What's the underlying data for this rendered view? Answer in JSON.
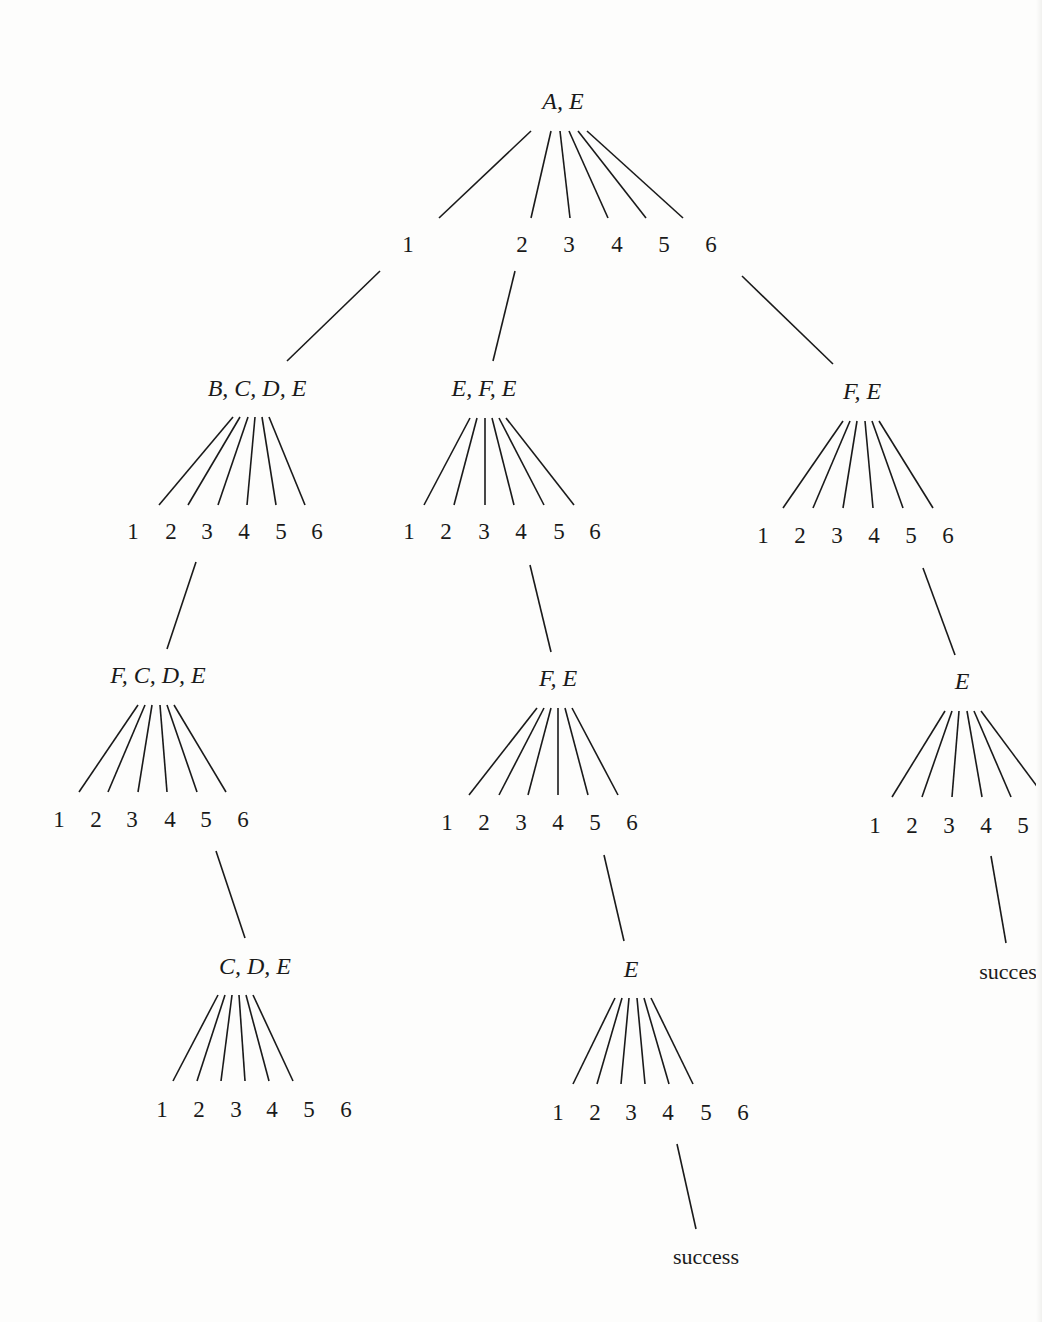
{
  "diagram": {
    "type": "search-tree",
    "colors": {
      "ink": "#1a1a1a",
      "background": "#fdfdfc"
    },
    "nodes": [
      {
        "id": "root",
        "label": "A, E",
        "x": 563,
        "y": 101
      },
      {
        "id": "n1",
        "label": "B, C, D, E",
        "x": 257,
        "y": 388
      },
      {
        "id": "n2",
        "label": "E, F, E",
        "x": 484,
        "y": 388
      },
      {
        "id": "n3",
        "label": "F, E",
        "x": 862,
        "y": 391
      },
      {
        "id": "n1_3",
        "label": "F, C, D, E",
        "x": 158,
        "y": 675
      },
      {
        "id": "n2_4",
        "label": "F, E",
        "x": 558,
        "y": 678
      },
      {
        "id": "n3_5",
        "label": "E",
        "x": 962,
        "y": 681
      },
      {
        "id": "n1_3_6",
        "label": "C, D, E",
        "x": 255,
        "y": 966
      },
      {
        "id": "n2_4_6",
        "label": "E",
        "x": 631,
        "y": 969
      }
    ],
    "branch_rows": [
      {
        "parent": "root",
        "labels": [
          "1",
          "2",
          "3",
          "4",
          "5",
          "6"
        ],
        "xs": [
          408,
          522,
          569,
          617,
          664,
          711
        ],
        "y": 245,
        "edges": [
          [
            531,
            131,
            439,
            218
          ],
          [
            551,
            131,
            531,
            218
          ],
          [
            560,
            131,
            570,
            218
          ],
          [
            569,
            131,
            608,
            218
          ],
          [
            578,
            131,
            646,
            218
          ],
          [
            587,
            131,
            683,
            218
          ]
        ]
      },
      {
        "parent": "n1",
        "labels": [
          "1",
          "2",
          "3",
          "4",
          "5",
          "6"
        ],
        "xs": [
          133,
          171,
          207,
          244,
          281,
          317
        ],
        "y": 532,
        "edges": [
          [
            233,
            417,
            159,
            505
          ],
          [
            240,
            417,
            188,
            505
          ],
          [
            248,
            417,
            218,
            505
          ],
          [
            255,
            417,
            247,
            505
          ],
          [
            262,
            417,
            276,
            505
          ],
          [
            269,
            417,
            305,
            505
          ]
        ]
      },
      {
        "parent": "n2",
        "labels": [
          "1",
          "2",
          "3",
          "4",
          "5",
          "6"
        ],
        "xs": [
          409,
          446,
          484,
          521,
          559,
          595
        ],
        "y": 532,
        "edges": [
          [
            470,
            418,
            424,
            505
          ],
          [
            477,
            418,
            454,
            505
          ],
          [
            485,
            418,
            485,
            505
          ],
          [
            492,
            418,
            514,
            505
          ],
          [
            499,
            418,
            544,
            505
          ],
          [
            506,
            418,
            574,
            505
          ]
        ]
      },
      {
        "parent": "n3",
        "labels": [
          "1",
          "2",
          "3",
          "4",
          "5",
          "6"
        ],
        "xs": [
          763,
          800,
          837,
          874,
          911,
          948
        ],
        "y": 536,
        "edges": [
          [
            843,
            421,
            783,
            508
          ],
          [
            850,
            421,
            813,
            508
          ],
          [
            857,
            421,
            843,
            508
          ],
          [
            865,
            421,
            873,
            508
          ],
          [
            872,
            421,
            903,
            508
          ],
          [
            879,
            421,
            933,
            508
          ]
        ]
      },
      {
        "parent": "n1_3",
        "labels": [
          "1",
          "2",
          "3",
          "4",
          "5",
          "6"
        ],
        "xs": [
          59,
          96,
          132,
          170,
          206,
          243
        ],
        "y": 820,
        "edges": [
          [
            138,
            705,
            79,
            792
          ],
          [
            145,
            705,
            108,
            792
          ],
          [
            152,
            705,
            138,
            792
          ],
          [
            160,
            705,
            167,
            792
          ],
          [
            167,
            705,
            197,
            792
          ],
          [
            174,
            705,
            226,
            792
          ]
        ]
      },
      {
        "parent": "n2_4",
        "labels": [
          "1",
          "2",
          "3",
          "4",
          "5",
          "6"
        ],
        "xs": [
          447,
          484,
          521,
          558,
          595,
          632
        ],
        "y": 823,
        "edges": [
          [
            537,
            708,
            469,
            795
          ],
          [
            544,
            708,
            499,
            795
          ],
          [
            551,
            708,
            528,
            795
          ],
          [
            558,
            708,
            558,
            795
          ],
          [
            565,
            708,
            588,
            795
          ],
          [
            572,
            708,
            618,
            795
          ]
        ]
      },
      {
        "parent": "n3_5",
        "labels": [
          "1",
          "2",
          "3",
          "4",
          "5"
        ],
        "xs": [
          875,
          912,
          949,
          986,
          1023
        ],
        "y": 826,
        "edges": [
          [
            945,
            711,
            892,
            797
          ],
          [
            952,
            711,
            922,
            797
          ],
          [
            959,
            711,
            952,
            797
          ],
          [
            967,
            711,
            982,
            797
          ],
          [
            974,
            711,
            1011,
            797
          ],
          [
            981,
            711,
            1042,
            793
          ]
        ]
      },
      {
        "parent": "n1_3_6",
        "labels": [
          "1",
          "2",
          "3",
          "4",
          "5",
          "6"
        ],
        "xs": [
          162,
          199,
          236,
          272,
          309,
          346
        ],
        "y": 1110,
        "edges": [
          [
            218,
            995,
            173,
            1081
          ],
          [
            225,
            995,
            197,
            1081
          ],
          [
            232,
            995,
            221,
            1081
          ],
          [
            239,
            995,
            245,
            1081
          ],
          [
            246,
            995,
            269,
            1081
          ],
          [
            253,
            995,
            293,
            1081
          ]
        ]
      },
      {
        "parent": "n2_4_6",
        "labels": [
          "1",
          "2",
          "3",
          "4",
          "5",
          "6"
        ],
        "xs": [
          558,
          595,
          631,
          668,
          706,
          743
        ],
        "y": 1113,
        "edges": [
          [
            615,
            998,
            573,
            1084
          ],
          [
            622,
            998,
            597,
            1084
          ],
          [
            629,
            998,
            621,
            1084
          ],
          [
            637,
            998,
            645,
            1084
          ],
          [
            644,
            998,
            669,
            1084
          ],
          [
            651,
            998,
            693,
            1084
          ]
        ]
      }
    ],
    "links": [
      {
        "from": "root/1",
        "to": "n1",
        "line": [
          380,
          271,
          287,
          361
        ]
      },
      {
        "from": "root/2",
        "to": "n2",
        "line": [
          515,
          271,
          493,
          361
        ]
      },
      {
        "from": "root/6",
        "to": "n3",
        "line": [
          742,
          276,
          833,
          364
        ]
      },
      {
        "from": "n1/3",
        "to": "n1_3",
        "line": [
          196,
          562,
          167,
          649
        ]
      },
      {
        "from": "n2/4",
        "to": "n2_4",
        "line": [
          530,
          565,
          551,
          652
        ]
      },
      {
        "from": "n3/5",
        "to": "n3_5",
        "line": [
          923,
          568,
          955,
          655
        ]
      },
      {
        "from": "n1_3/5",
        "to": "n1_3_6",
        "line": [
          216,
          851,
          245,
          938
        ]
      },
      {
        "from": "n2_4/6",
        "to": "n2_4_6",
        "line": [
          604,
          855,
          624,
          941
        ]
      },
      {
        "from": "n3_5/4",
        "to": "success_right",
        "line": [
          991,
          856,
          1006,
          943
        ]
      },
      {
        "from": "n2_4_6/4",
        "to": "success_bottom",
        "line": [
          677,
          1144,
          696,
          1229
        ]
      }
    ],
    "terminals": [
      {
        "id": "success_right",
        "label": "succes",
        "x": 1008,
        "y": 972
      },
      {
        "id": "success_bottom",
        "label": "success",
        "x": 706,
        "y": 1257
      }
    ]
  }
}
